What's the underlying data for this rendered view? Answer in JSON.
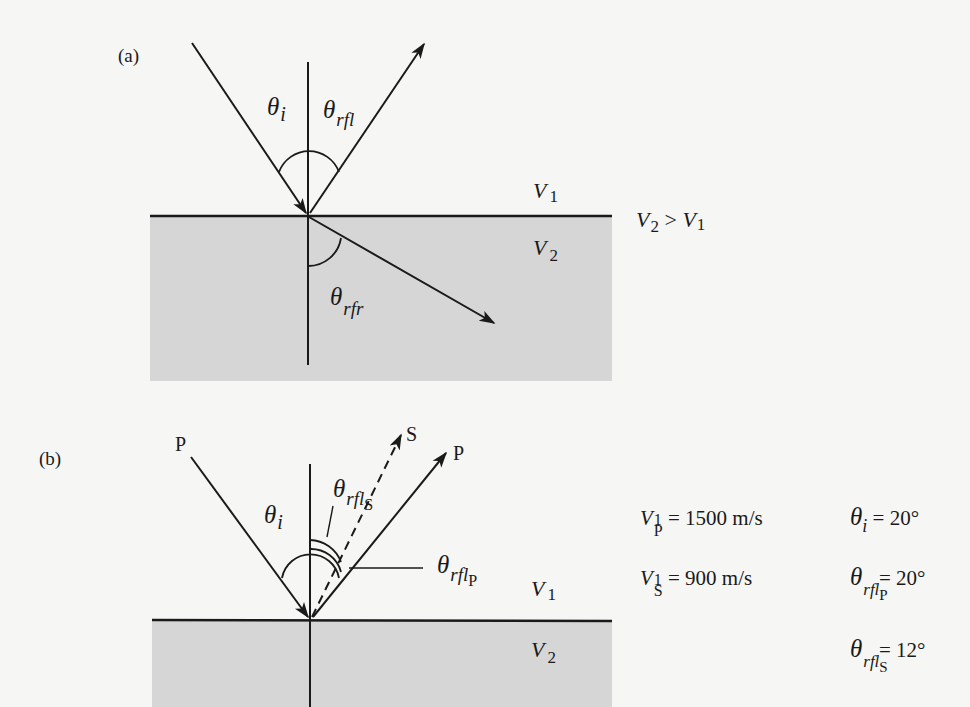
{
  "figure": {
    "background_color": "#f6f6f4",
    "layer2_fill": "#d6d6d6",
    "line_color": "#1a1a1a"
  },
  "panel_a": {
    "label": "(a)",
    "symbols": {
      "theta": "θ",
      "incidence_sub": "i",
      "reflection_sub": "rfl",
      "refraction_sub": "rfr"
    },
    "layer1_label": {
      "main": "V",
      "sub": "1"
    },
    "layer2_label": {
      "main": "V",
      "sub": "2"
    },
    "condition": {
      "lhs_main": "V",
      "lhs_sub": "2",
      "op": " > ",
      "rhs_main": "V",
      "rhs_sub": "1"
    }
  },
  "panel_b": {
    "label": "(b)",
    "ray_labels": {
      "incident": "P",
      "reflected_p": "P",
      "reflected_s": "S"
    },
    "symbols": {
      "theta": "θ",
      "incidence_sub": "i",
      "reflection_sub": "rfl",
      "p_sub": "P",
      "s_sub": "S"
    },
    "layer1_label": {
      "main": "V",
      "sub": "1"
    },
    "layer2_label": {
      "main": "V",
      "sub": "2"
    },
    "parameters": [
      {
        "main": "V",
        "sub": "1",
        "subsub": "P",
        "value": " = 1500 m/s"
      },
      {
        "main": "V",
        "sub": "1",
        "subsub": "S",
        "value": " = 900 m/s"
      }
    ],
    "angles": [
      {
        "main": "θ",
        "sub": "i",
        "subsub": "",
        "value": " = 20°"
      },
      {
        "main": "θ",
        "sub": "rfl",
        "subsub": "P",
        "value": " = 20°"
      },
      {
        "main": "θ",
        "sub": "rfl",
        "subsub": "S",
        "value": " = 12°"
      }
    ]
  }
}
